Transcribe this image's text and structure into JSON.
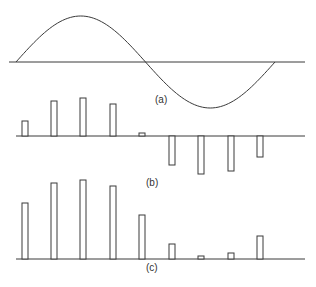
{
  "colors": {
    "stroke": "#3a3a3a",
    "background": "#ffffff",
    "bar_fill": "#ffffff"
  },
  "panels": {
    "a": {
      "label": "(a)",
      "description": "One full period of a sine wave"
    },
    "b": {
      "label": "(b)",
      "description": "Sampled values (signed bars)"
    },
    "c": {
      "label": "(c)",
      "description": "Magnitudes (unsigned bars)"
    }
  },
  "chart_data": [
    {
      "type": "line",
      "title": "(a)",
      "series": [
        {
          "name": "sine",
          "function": "sin",
          "periods": 1
        }
      ],
      "x": [
        0,
        0.25,
        0.5,
        0.75,
        1.0
      ],
      "values": [
        0,
        1,
        0,
        -1,
        0
      ]
    },
    {
      "type": "bar",
      "title": "(b)",
      "categories": [
        "1",
        "2",
        "3",
        "4",
        "5",
        "6",
        "7",
        "8",
        "9"
      ],
      "values": [
        15,
        35,
        38,
        32,
        3,
        -29,
        -38,
        -35,
        -21
      ]
    },
    {
      "type": "bar",
      "title": "(c)",
      "categories": [
        "1",
        "2",
        "3",
        "4",
        "5",
        "6",
        "7",
        "8",
        "9"
      ],
      "values": [
        56,
        76,
        79,
        73,
        44,
        15,
        3,
        6,
        23
      ]
    }
  ]
}
